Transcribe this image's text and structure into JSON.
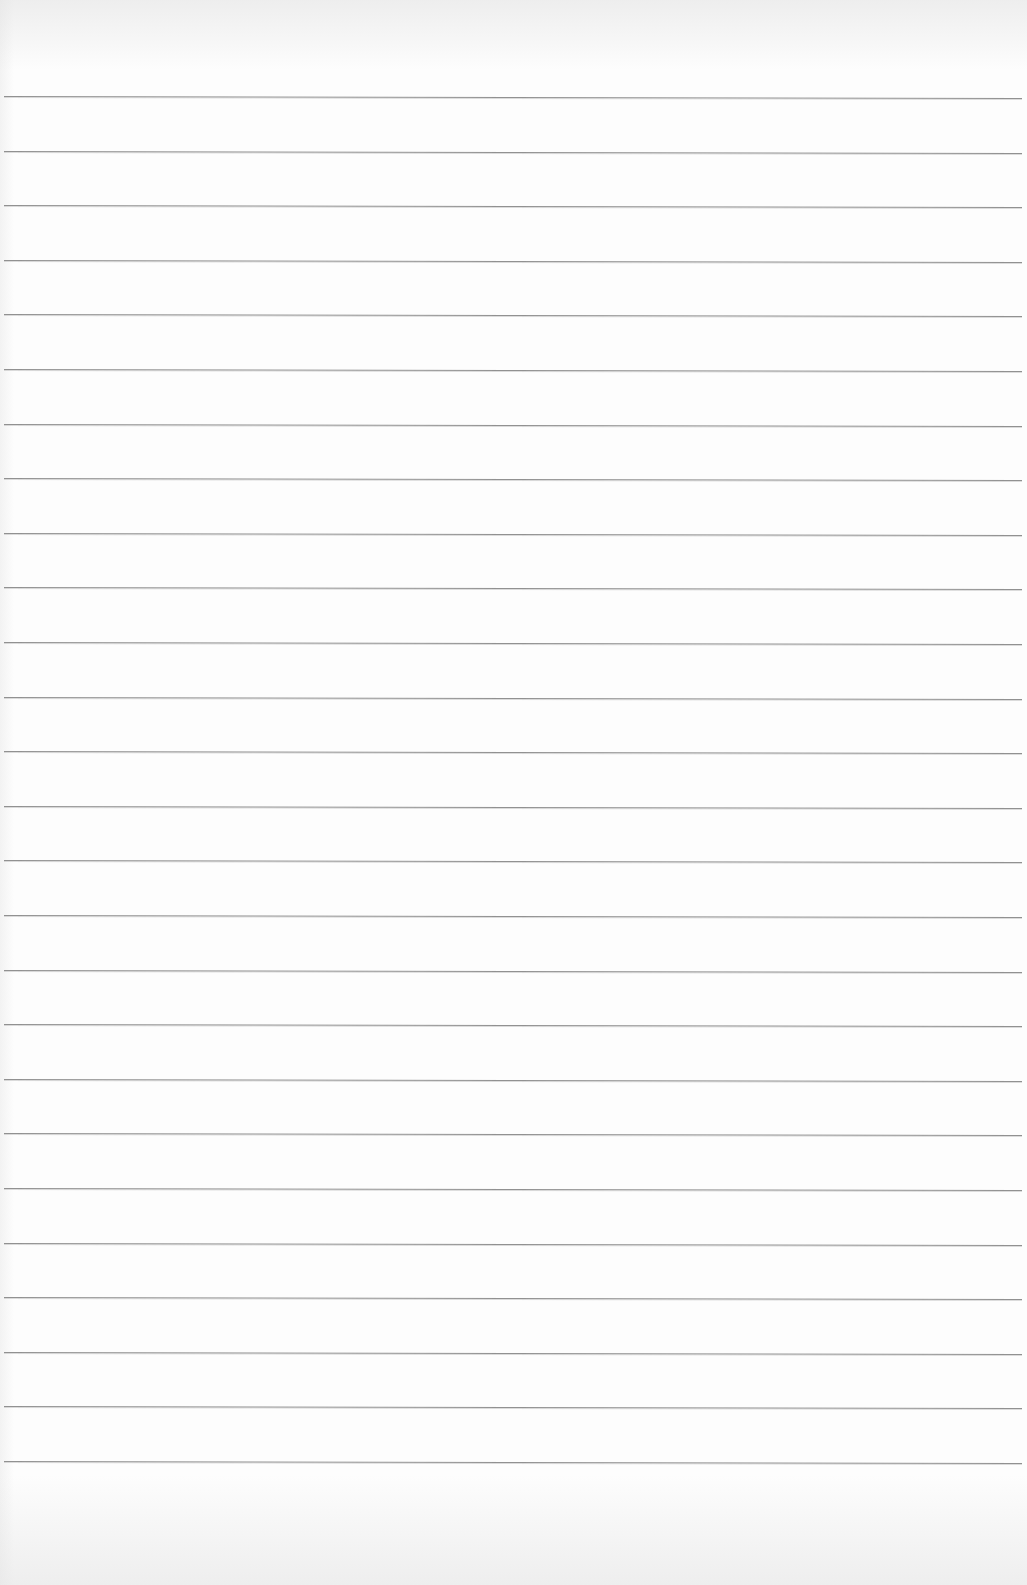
{
  "document": {
    "type": "lined-paper",
    "content_text": "",
    "line_count": 26,
    "first_line_y": 96,
    "line_spacing_px": 54.6,
    "line_left_x": 4,
    "line_width_px": 1018,
    "colors": {
      "paper": "#fdfdfd",
      "rule": "#8c8c8c"
    }
  }
}
